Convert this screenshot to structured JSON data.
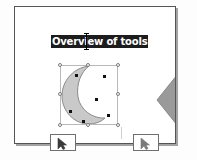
{
  "app": {
    "type": "slide-editor-canvas",
    "canvas_background": "#ffffff",
    "slide_background": "#ffffff",
    "slide_border_color": "#555555"
  },
  "slide": {
    "title": {
      "text": "Overview of tools",
      "state": "selected",
      "highlight_color": "#1c1c1c",
      "text_color": "#ffffff",
      "caret_visible": true
    },
    "shapes": [
      {
        "name": "crescent-moon",
        "label": "Moon",
        "fill": "#c9c9c9",
        "stroke": "#8a8a8a",
        "selected": true,
        "handle_count": 8,
        "node_count": 6
      },
      {
        "name": "diamond",
        "label": "Diamond",
        "fill": "#9a9a9a",
        "stroke": "#8a8a8a",
        "selected": false,
        "clipped": true
      }
    ]
  },
  "overlays": {
    "cursors": [
      {
        "name": "pointer-cursor-left",
        "glyph": "arrow-pointer",
        "color": "#3a3a3a"
      },
      {
        "name": "pointer-cursor-right",
        "glyph": "arrow-pointer",
        "color": "#6a6a6a"
      }
    ]
  }
}
